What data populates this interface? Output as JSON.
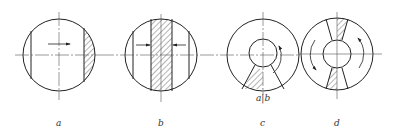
{
  "figure": {
    "panels": [
      {
        "label": "a",
        "description": "circle with hatched right segment, arrow pointing right"
      },
      {
        "label": "b",
        "description": "circle with hatched central vertical band, arrows pointing inward from both sides"
      },
      {
        "label": "c",
        "description": "annulus with hatched bottom sector, curved arrow counterclockwise on right",
        "annotation": "a|b"
      },
      {
        "label": "d",
        "description": "annulus with two opposite hatched sectors top and bottom, curved arrows on both sides"
      }
    ]
  },
  "colors": {
    "line": "#222222",
    "hatch": "#444444",
    "background": "#ffffff"
  }
}
